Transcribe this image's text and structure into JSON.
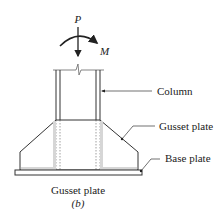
{
  "diagram": {
    "load_label": "P",
    "moment_label": "M",
    "callouts": {
      "column": "Column",
      "gusset_plate": "Gusset plate",
      "base_plate": "Base plate"
    },
    "caption": "Gusset plate",
    "subfigure_label": "(b)"
  },
  "colors": {
    "line": "#333333",
    "shade": "#cfcfcf"
  }
}
